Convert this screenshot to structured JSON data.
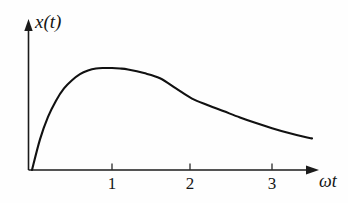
{
  "figure": {
    "background_color": "#fefefe",
    "ink_color": "#111111",
    "y_axis_label": "x(t)",
    "x_axis_label": "ωt"
  },
  "chart_data": {
    "type": "line",
    "title": "",
    "subtitle": "",
    "xlabel": "ωt",
    "ylabel": "x(t)",
    "xlim": [
      0,
      3.6
    ],
    "ylim": [
      0,
      1.12
    ],
    "grid": false,
    "legend": null,
    "legend_position": "none",
    "x_ticks": [
      1,
      2,
      3
    ],
    "x_tick_labels": [
      "1",
      "2",
      "3"
    ],
    "y_ticks": [],
    "y_tick_labels": [],
    "axis_arrows": [
      "x-positive",
      "y-positive"
    ],
    "annotations": [],
    "series": [
      {
        "name": "x(t)",
        "color": "#111111",
        "line_width": 2.1,
        "x": [
          0.0,
          0.1,
          0.2,
          0.3,
          0.4,
          0.5,
          0.6,
          0.7,
          0.8,
          0.9,
          1.0,
          1.1,
          1.2,
          1.4,
          1.6,
          1.8,
          2.0,
          2.2,
          2.4,
          2.6,
          2.8,
          3.0,
          3.2,
          3.4,
          3.5
        ],
        "y": [
          0.0,
          0.3,
          0.52,
          0.68,
          0.8,
          0.88,
          0.94,
          0.975,
          0.995,
          1.0,
          1.0,
          0.995,
          0.985,
          0.95,
          0.9,
          0.8,
          0.7,
          0.635,
          0.575,
          0.515,
          0.46,
          0.41,
          0.365,
          0.325,
          0.31
        ]
      }
    ]
  }
}
